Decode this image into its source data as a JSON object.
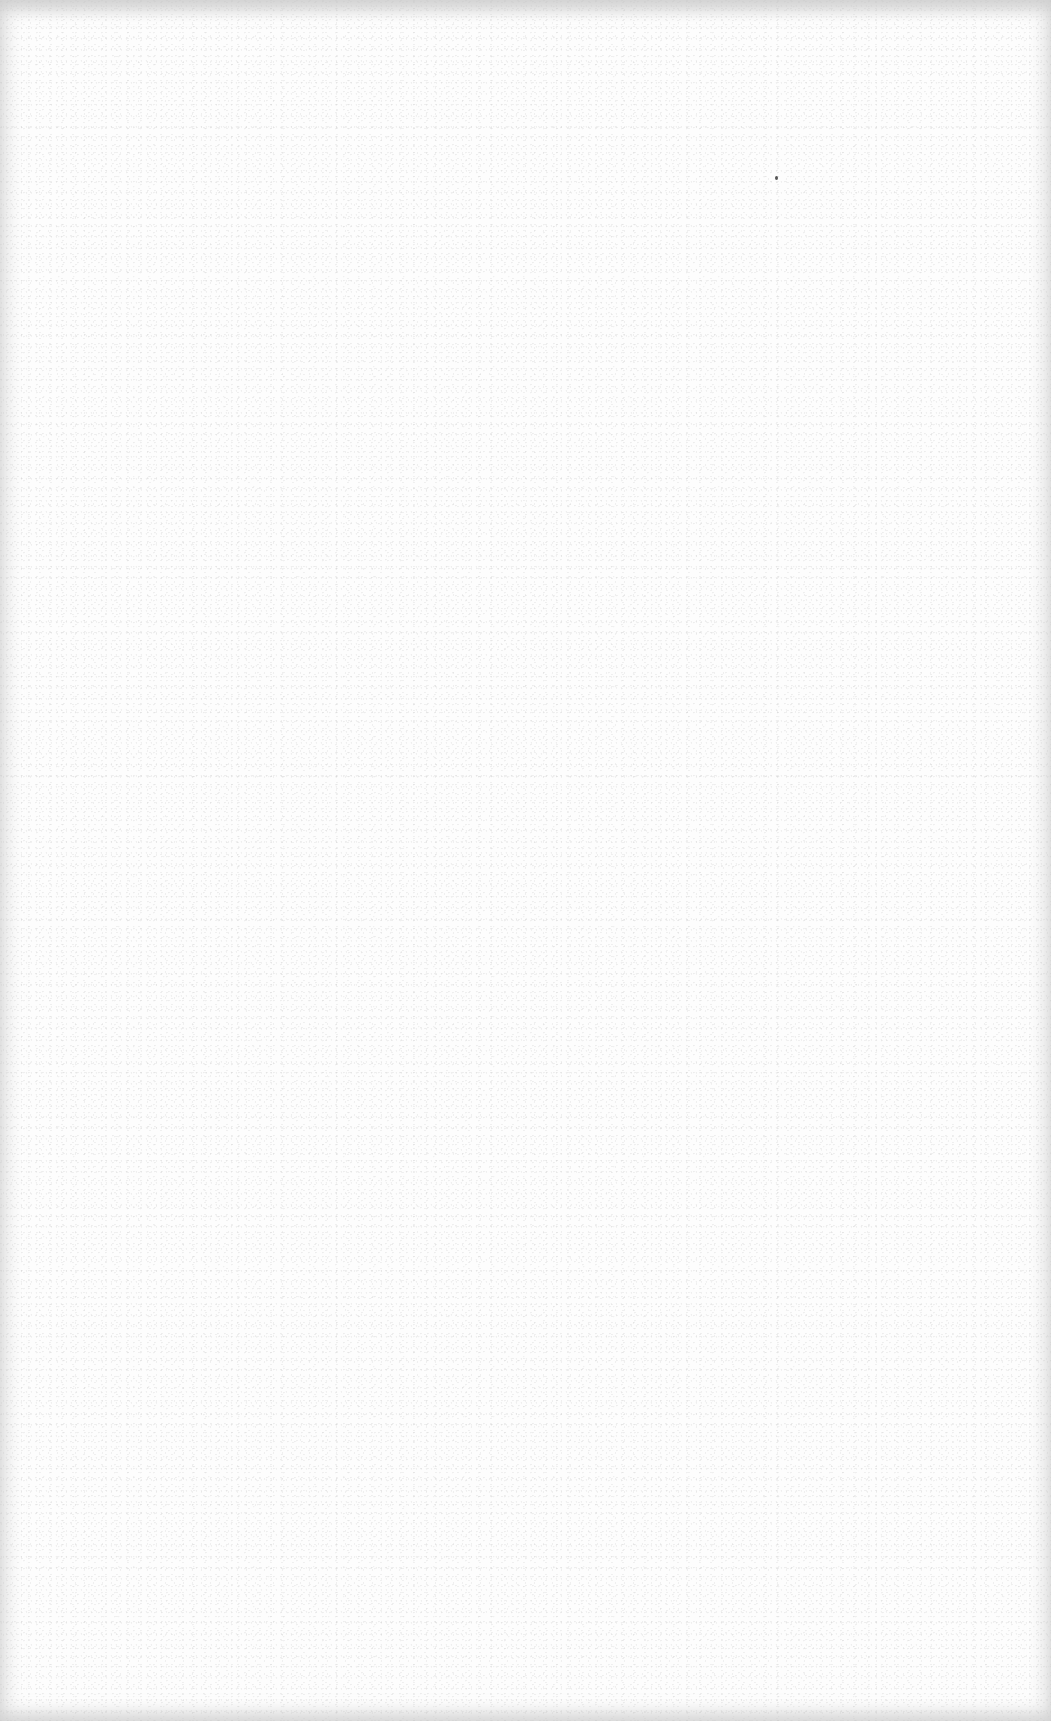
{
  "page": {
    "type": "blank-scanned-page",
    "background_color": "#fdfdfd",
    "edge_shade_color": "#c8c8c8",
    "text_content": ""
  },
  "artifacts": [
    {
      "kind": "speck",
      "x": 775,
      "y": 176,
      "color": "#555555"
    }
  ]
}
